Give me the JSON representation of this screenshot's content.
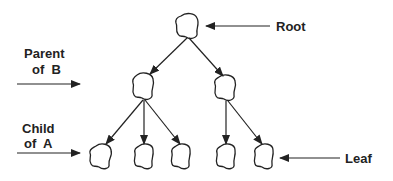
{
  "diagram": {
    "type": "tree",
    "labels": {
      "root": "Root",
      "parent_line1": "Parent",
      "parent_line2": "of  B",
      "child_line1": "Child",
      "child_line2": "of  A",
      "leaf": "Leaf"
    },
    "nodes": [
      {
        "id": "root",
        "level": 0
      },
      {
        "id": "B",
        "level": 1,
        "parent": "root"
      },
      {
        "id": "C",
        "level": 1,
        "parent": "root"
      },
      {
        "id": "A",
        "level": 2,
        "parent": "B"
      },
      {
        "id": "D",
        "level": 2,
        "parent": "B"
      },
      {
        "id": "E",
        "level": 2,
        "parent": "B"
      },
      {
        "id": "F",
        "level": 2,
        "parent": "C"
      },
      {
        "id": "G",
        "level": 2,
        "parent": "C"
      }
    ],
    "colors": {
      "stroke": "#222222",
      "background": "#ffffff"
    }
  }
}
